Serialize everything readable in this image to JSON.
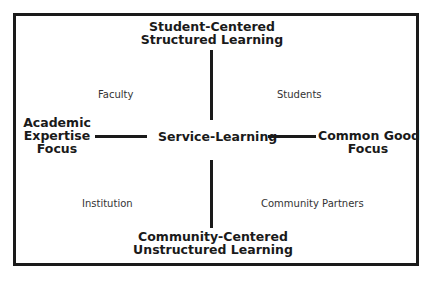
{
  "diagram": {
    "top_axis_label": [
      "Student-Centered",
      "Structured Learning"
    ],
    "bottom_axis_label": [
      "Community-Centered",
      "Unstructured Learning"
    ],
    "left_axis_label": [
      "Academic",
      "Expertise",
      "Focus"
    ],
    "right_axis_label": [
      "Common Good",
      "Focus"
    ],
    "center_label": "Service-Learning",
    "quadrants": {
      "top_left": "Faculty",
      "top_right": "Students",
      "bottom_left": "Institution",
      "bottom_right": "Community Partners"
    },
    "colors": {
      "line": "#1a1a1a",
      "background": "#ffffff"
    }
  }
}
